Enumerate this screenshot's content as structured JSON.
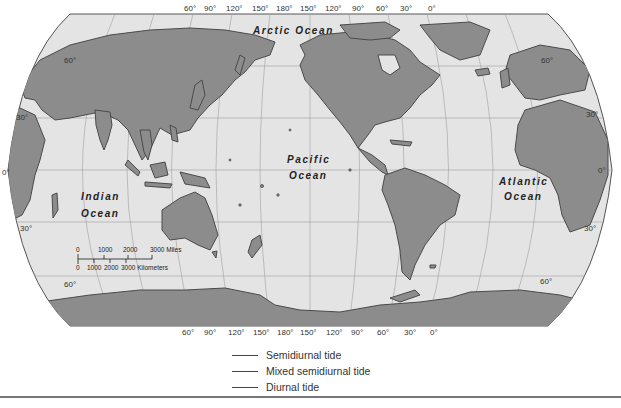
{
  "map": {
    "projection": "Robinson (Pacific-centered)",
    "colors": {
      "ocean": "#e4e4e4",
      "land": "#8c8c8c",
      "coast": "#4a4a4a",
      "grid": "#9a9a9a",
      "border": "#555555"
    },
    "top_longitudes": [
      "60°",
      "90°",
      "120°",
      "150°",
      "180°",
      "150°",
      "120°",
      "90°",
      "60°",
      "30°",
      "0°"
    ],
    "bottom_longitudes": [
      "60°",
      "90°",
      "120°",
      "150°",
      "180°",
      "150°",
      "120°",
      "90°",
      "60°",
      "30°",
      "0°"
    ],
    "left_latitudes": [
      "60°",
      "30°",
      "0°",
      "30°",
      "60°"
    ],
    "right_latitudes": [
      "60°",
      "30°",
      "0°",
      "30°",
      "60°"
    ],
    "oceans": {
      "arctic": "Arctic Ocean",
      "pacific_line1": "Pacific",
      "pacific_line2": "Ocean",
      "indian_line1": "Indian",
      "indian_line2": "Ocean",
      "atlantic_line1": "Atlantic",
      "atlantic_line2": "Ocean"
    },
    "scale": {
      "miles_ticks": [
        "0",
        "1000",
        "2000",
        "3000 Miles"
      ],
      "km_ticks": [
        "0",
        "1000",
        "2000",
        "3000 Kilometers"
      ]
    }
  },
  "legend": {
    "items": [
      {
        "label": "Semidiurnal tide"
      },
      {
        "label": "Mixed semidiurnal tide"
      },
      {
        "label": "Diurnal tide"
      }
    ]
  }
}
